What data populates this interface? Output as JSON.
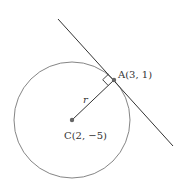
{
  "diagram": {
    "center": {
      "label": "C(2, −5)",
      "x": 2,
      "y": -5
    },
    "point_of_tangency": {
      "label": "A(3, 1)",
      "x": 3,
      "y": 1
    },
    "radius_label": "r",
    "elements": [
      "circle",
      "tangent-line",
      "radius-segment",
      "right-angle-marker"
    ],
    "colors": {
      "stroke": "#555555",
      "line": "#333333",
      "point": "#666666"
    }
  }
}
